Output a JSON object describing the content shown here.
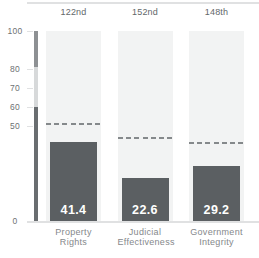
{
  "chart_data": {
    "type": "bar",
    "title": "",
    "categories": [
      "Property Rights",
      "Judicial Effectiveness",
      "Government Integrity"
    ],
    "category_lines": [
      [
        "Property",
        "Rights"
      ],
      [
        "Judicial",
        "Effectiveness"
      ],
      [
        "Government",
        "Integrity"
      ]
    ],
    "values": [
      41.4,
      22.6,
      29.2
    ],
    "value_labels": [
      "41.4",
      "22.6",
      "29.2"
    ],
    "rank_labels": [
      "122nd",
      "152nd",
      "148th"
    ],
    "series": [
      {
        "name": "country score",
        "values": [
          41.4,
          22.6,
          29.2
        ]
      },
      {
        "name": "world average (dashed)",
        "values": [
          51,
          43.5,
          41
        ]
      }
    ],
    "world_averages": [
      51,
      43.5,
      41
    ],
    "ylim": [
      0,
      100
    ],
    "yticks": [
      100,
      80,
      70,
      60,
      50,
      0
    ],
    "grid": false,
    "legend": "none",
    "axis_segments": [
      {
        "from": 100,
        "to": 81,
        "color": "#8d9093"
      },
      {
        "from": 81,
        "to": 60,
        "color": "#d7d9da"
      },
      {
        "from": 60,
        "to": 0,
        "color": "#696d70"
      }
    ],
    "colors": {
      "bar": "#5b5f62",
      "track": "#f2f3f3",
      "dash": "#85898b",
      "value_text": "#ffffff",
      "rank_text": "#63676a",
      "tick_text": "#6e7174",
      "category_text": "#85888b",
      "rule": "#e0e1e2"
    }
  }
}
